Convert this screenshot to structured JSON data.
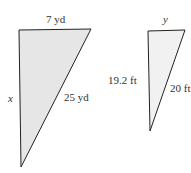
{
  "figure": {
    "triangles": [
      {
        "id": "large",
        "fill": "#e6e6e6",
        "stroke": "#222222",
        "labels": {
          "top": "7 yd",
          "left": "x",
          "hypotenuse": "25 yd"
        }
      },
      {
        "id": "small",
        "fill": "#f1f1f1",
        "stroke": "#222222",
        "labels": {
          "top": "y",
          "left": "19.2 ft",
          "hypotenuse": "20 ft"
        }
      }
    ]
  }
}
